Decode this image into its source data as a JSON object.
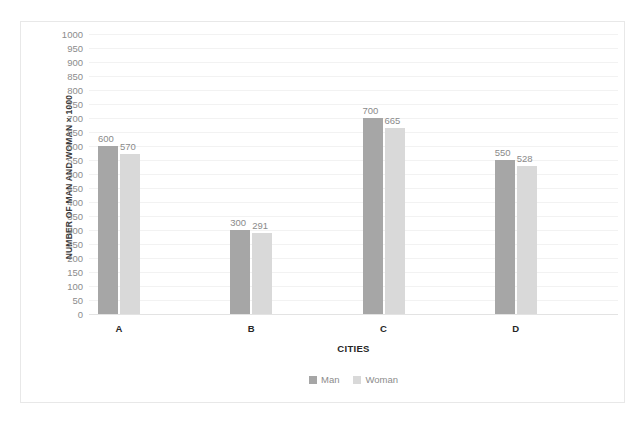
{
  "chart_data": {
    "type": "bar",
    "title": "",
    "subtitle": "",
    "xlabel": "CITIES",
    "ylabel": "NUMBER OF MAN AND WOMAN × 1000",
    "categories": [
      "A",
      "B",
      "C",
      "D"
    ],
    "series": [
      {
        "name": "Man",
        "color": "#A6A6A6",
        "values": [
          600,
          300,
          700,
          550
        ]
      },
      {
        "name": "Woman",
        "color": "#D9D9D9",
        "values": [
          570,
          291,
          665,
          528
        ]
      }
    ],
    "ylim": [
      0,
      1000
    ],
    "ytick_step": 50,
    "yticks": [
      0,
      50,
      100,
      150,
      200,
      250,
      300,
      350,
      400,
      450,
      500,
      550,
      600,
      650,
      700,
      750,
      800,
      850,
      900,
      950,
      1000
    ],
    "ytick_labels": [
      "0",
      "50",
      "100",
      "150",
      "200",
      "250",
      "300",
      "350",
      "400",
      "450",
      "500",
      "550",
      "600",
      "650",
      "700",
      "750",
      "800",
      "850",
      "900",
      "950",
      "1000"
    ],
    "data_labels": [
      [
        "600",
        "570"
      ],
      [
        "300",
        "291"
      ],
      [
        "700",
        "665"
      ],
      [
        "550",
        "528"
      ]
    ],
    "grid": true,
    "grid_axis": "y",
    "legend": true,
    "legend_position": "bottom",
    "legend_entries": [
      "Man",
      "Woman"
    ],
    "plot_background": "#FFFFFF",
    "gridline_color": "#F2F2F2",
    "axis_line_color": "#E3E3E3",
    "label_color": "#8C8C8C",
    "frame_border_color": "#E8E8E8"
  }
}
